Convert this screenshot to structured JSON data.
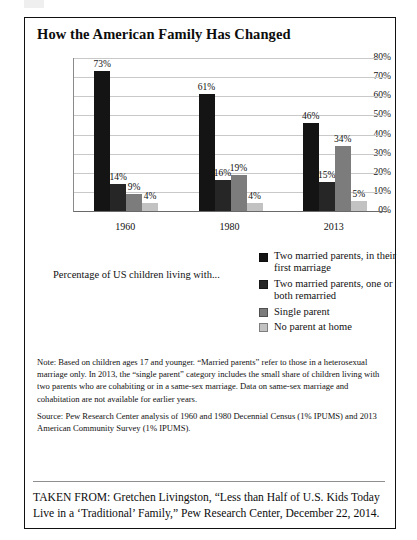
{
  "figure": {
    "title": "How the American Family Has Changed"
  },
  "chart_data": {
    "type": "bar",
    "title": "How the American Family Has Changed",
    "xlabel": "",
    "ylabel": "",
    "ylim": [
      0,
      80
    ],
    "grid": true,
    "legend_position": "below-right",
    "categories": [
      "1960",
      "1980",
      "2013"
    ],
    "ytick_labels": [
      "80%",
      "70%",
      "60%",
      "50%",
      "40%",
      "30%",
      "20%",
      "10%",
      "0%"
    ],
    "ytick_values": [
      80,
      70,
      60,
      50,
      40,
      30,
      20,
      10,
      0
    ],
    "series": [
      {
        "name": "Two married parents, in their first marriage",
        "color": "#141414",
        "values": [
          73,
          61,
          46
        ],
        "labels": [
          "73%",
          "61%",
          "46%"
        ]
      },
      {
        "name": "Two married parents, one or both remarried",
        "color": "#262626",
        "values": [
          14,
          16,
          15
        ],
        "labels": [
          "14%",
          "16%",
          "15%"
        ]
      },
      {
        "name": "Single parent",
        "color": "#7c7c7c",
        "values": [
          9,
          19,
          34
        ],
        "labels": [
          "9%",
          "19%",
          "34%"
        ]
      },
      {
        "name": "No parent at home",
        "color": "#c2c2c2",
        "values": [
          4,
          4,
          5
        ],
        "labels": [
          "4%",
          "4%",
          "5%"
        ]
      }
    ]
  },
  "legend": {
    "caption": "Percentage of US children living with...",
    "items": [
      {
        "label": "Two married parents, in their first marriage",
        "color": "#141414"
      },
      {
        "label": "Two married parents, one or both remarried",
        "color": "#262626"
      },
      {
        "label": "Single parent",
        "color": "#7c7c7c"
      },
      {
        "label": "No parent at home",
        "color": "#c2c2c2"
      }
    ]
  },
  "footer": {
    "note": "Note: Based on children ages 17 and younger. “Married parents” refer to those in a heterosexual marriage only. In 2013, the “single parent” category includes the small share of children living with two parents who are cohabiting or in a same-sex marriage. Data on same-sex marriage and cohabitation are not available for earlier years.",
    "source": "Source: Pew Research Center analysis of 1960 and 1980 Decennial Census (1% IPUMS) and 2013 American Community Survey (1% IPUMS).",
    "taken_from": "TAKEN FROM: Gretchen Livingston, “Less than Half of U.S. Kids Today Live in a ‘Traditional’ Family,” Pew Research Center, December 22, 2014."
  }
}
